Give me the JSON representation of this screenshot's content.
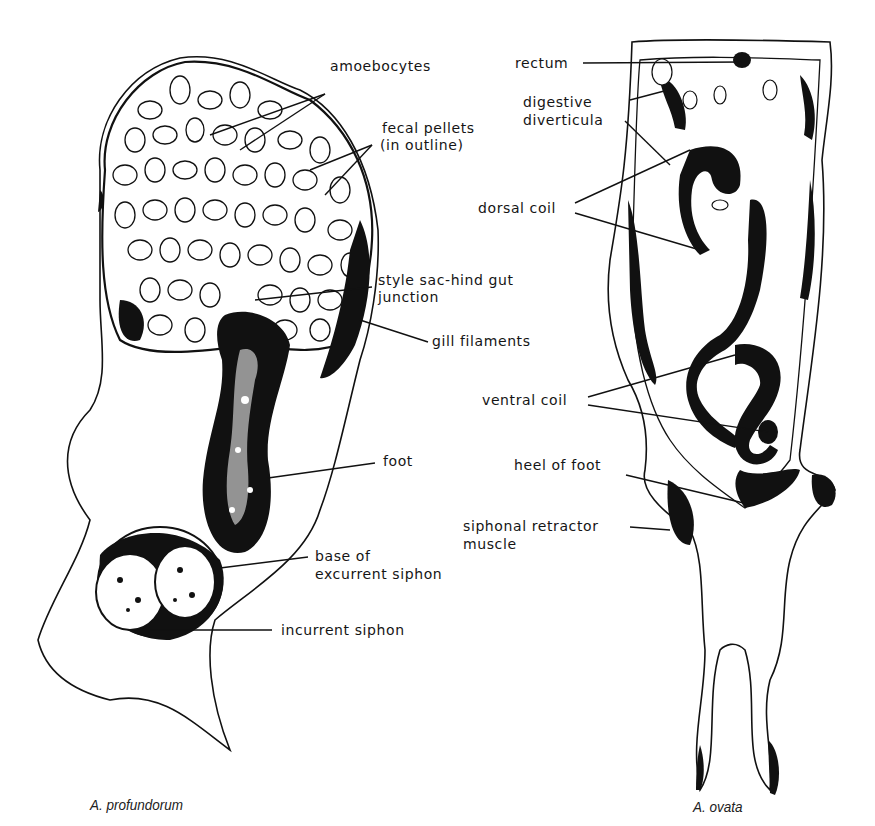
{
  "figure": {
    "left_specimen": {
      "caption": "A. profundorum",
      "labels": [
        {
          "id": "amoebocytes",
          "text": "amoebocytes"
        },
        {
          "id": "fecal-pellets-1",
          "text": "fecal pellets"
        },
        {
          "id": "fecal-pellets-2",
          "text": "(in outline)"
        },
        {
          "id": "style-sac-1",
          "text": "style sac-hind gut"
        },
        {
          "id": "style-sac-2",
          "text": "junction"
        },
        {
          "id": "gill-filaments",
          "text": "gill filaments"
        },
        {
          "id": "foot",
          "text": "foot"
        },
        {
          "id": "base-excurrent-1",
          "text": "base of"
        },
        {
          "id": "base-excurrent-2",
          "text": "excurrent siphon"
        },
        {
          "id": "incurrent-siphon",
          "text": "incurrent siphon"
        }
      ]
    },
    "right_specimen": {
      "caption": "A. ovata",
      "labels": [
        {
          "id": "rectum",
          "text": "rectum"
        },
        {
          "id": "digestive-1",
          "text": "digestive"
        },
        {
          "id": "digestive-2",
          "text": "diverticula"
        },
        {
          "id": "dorsal-coil",
          "text": "dorsal coil"
        },
        {
          "id": "ventral-coil",
          "text": "ventral coil"
        },
        {
          "id": "heel-of-foot",
          "text": "heel of foot"
        },
        {
          "id": "siphonal-1",
          "text": "siphonal retractor"
        },
        {
          "id": "siphonal-2",
          "text": "muscle"
        }
      ]
    },
    "colors": {
      "ink": "#111111",
      "paper": "#ffffff"
    }
  }
}
